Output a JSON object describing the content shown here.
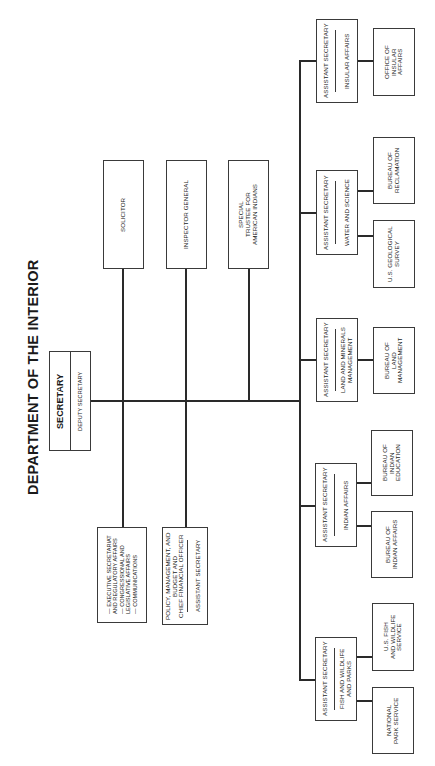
{
  "page": {
    "title": "DEPARTMENT OF THE INTERIOR"
  },
  "secretary": {
    "title": "SECRETARY",
    "deputy": "DEPUTY SECRETARY"
  },
  "staff_offices": {
    "items": [
      "— EXECUTIVE SECRETARIAT",
      "AND REGULATORY AFFAIRS",
      "— CONGRESSIONAL AND",
      "LEGISLATIVE AFFAIRS",
      "— COMMUNICATIONS"
    ]
  },
  "policy_box": {
    "title": "ASSISTANT SECRETARY",
    "subtitle_lines": [
      "POLICY, MANAGEMENT, AND",
      "BUDGET AND",
      "CHIEF FINANCIAL OFFICER"
    ]
  },
  "top_offices": [
    {
      "label": "SOLICITOR"
    },
    {
      "label": "INSPECTOR GENERAL"
    },
    {
      "label_lines": [
        "SPECIAL",
        "TRUSTEE FOR",
        "AMERICAN INDIANS"
      ]
    }
  ],
  "assistant_secretaries": [
    {
      "title": "ASSISTANT SECRETARY",
      "area_lines": [
        "INSULAR AFFAIRS"
      ],
      "bureaus": [
        {
          "lines": [
            "OFFICE OF",
            "INSULAR",
            "AFFAIRS"
          ]
        }
      ]
    },
    {
      "title": "ASSISTANT SECRETARY",
      "area_lines": [
        "WATER AND SCIENCE"
      ],
      "bureaus": [
        {
          "lines": [
            "BUREAU OF",
            "RECLAMATION"
          ]
        },
        {
          "lines": [
            "U.S. GEOLOGICAL",
            "SURVEY"
          ]
        }
      ]
    },
    {
      "title": "ASSISTANT SECRETARY",
      "area_lines": [
        "LAND AND MINERALS",
        "MANAGEMENT"
      ],
      "bureaus": [
        {
          "lines": [
            "BUREAU OF",
            "LAND",
            "MANAGEMENT"
          ]
        }
      ]
    },
    {
      "title": "ASSISTANT SECRETARY",
      "area_lines": [
        "INDIAN AFFAIRS"
      ],
      "bureaus": [
        {
          "lines": [
            "BUREAU OF",
            "INDIAN",
            "EDUCATION"
          ]
        },
        {
          "lines": [
            "BUREAU OF",
            "INDIAN AFFAIRS"
          ]
        }
      ]
    },
    {
      "title": "ASSISTANT SECRETARY",
      "area_lines": [
        "FISH AND WILDLIFE",
        "AND PARKS"
      ],
      "bureaus": [
        {
          "lines": [
            "U.S. FISH",
            "AND WILDLIFE",
            "SERVICE"
          ]
        },
        {
          "lines": [
            "NATIONAL",
            "PARK SERVICE"
          ]
        }
      ]
    }
  ]
}
